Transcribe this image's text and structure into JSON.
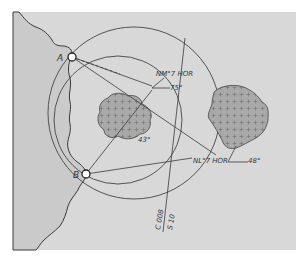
{
  "figure": {
    "background": "#ffffff",
    "map_fill": "#d6d6d6",
    "sea_fill": "#c9c9c9",
    "line_color": "#3a3a3a",
    "shoal_fill": "#a9a9a9"
  },
  "points": {
    "a_label": "A",
    "b_label": "B"
  },
  "labels": {
    "bearing_top": "NM°7 HOR",
    "angle_top": "75°",
    "angle_shoal": "43°",
    "bearing_right": "NL°7 HOR",
    "angle_right": "48°",
    "line_label_1": "C 008",
    "line_label_2": "S 10"
  }
}
